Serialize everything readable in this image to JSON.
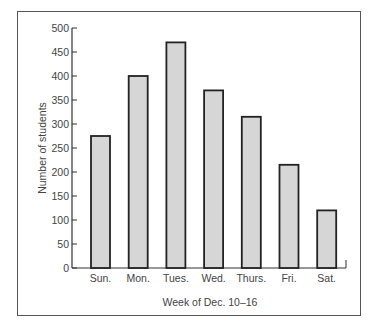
{
  "chart_data": {
    "type": "bar",
    "title": "",
    "xlabel": "Week of Dec. 10–16",
    "ylabel": "Number of students",
    "categories": [
      "Sun.",
      "Mon.",
      "Tues.",
      "Wed.",
      "Thurs.",
      "Fri.",
      "Sat."
    ],
    "values": [
      275,
      400,
      470,
      370,
      315,
      215,
      120
    ],
    "ylim": [
      0,
      500
    ],
    "yticks": [
      0,
      50,
      100,
      150,
      200,
      250,
      300,
      350,
      400,
      450,
      500
    ],
    "grid": false,
    "legend": null,
    "bar_fill": "#d6d6d6",
    "bar_stroke": "#222222"
  }
}
